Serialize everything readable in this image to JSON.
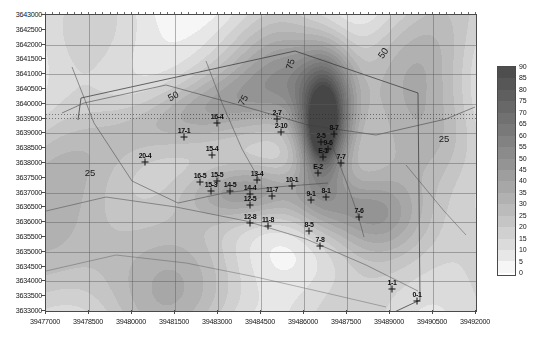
{
  "chart_data": {
    "type": "heatmap",
    "title": "",
    "xlabel": "",
    "ylabel": "",
    "xlim": [
      39477000,
      39492000
    ],
    "ylim": [
      3633000,
      3643000
    ],
    "xticks": [
      39477000,
      39478500,
      39480000,
      39481500,
      39483000,
      39484500,
      39486000,
      39487500,
      39489000,
      39490500,
      39492000
    ],
    "yticks": [
      3633000,
      3633500,
      3634000,
      3634500,
      3635000,
      3635500,
      3636000,
      3636500,
      3637000,
      3637500,
      3638000,
      3638500,
      3639000,
      3639500,
      3640000,
      3640500,
      3641000,
      3641500,
      3642000,
      3642500,
      3643000
    ],
    "grid": true,
    "colorbar": {
      "min": 0,
      "max": 90,
      "step": 5,
      "ticks": [
        90,
        85,
        80,
        75,
        70,
        65,
        60,
        55,
        50,
        45,
        40,
        35,
        30,
        25,
        20,
        15,
        10,
        5,
        0
      ],
      "position": "right",
      "scheme": "grayscale"
    },
    "contour_labels": [
      {
        "text": "50",
        "x": 172,
        "y": 95,
        "rot": -28
      },
      {
        "text": "75",
        "x": 242,
        "y": 99,
        "rot": -62
      },
      {
        "text": "75",
        "x": 289,
        "y": 63,
        "rot": -75
      },
      {
        "text": "50",
        "x": 382,
        "y": 52,
        "rot": -55
      },
      {
        "text": "25",
        "x": 89,
        "y": 171,
        "rot": 0
      },
      {
        "text": "25",
        "x": 443,
        "y": 137,
        "rot": 0
      }
    ],
    "points": [
      {
        "id": "17-1",
        "label": "17-1",
        "x": 183,
        "y": 136
      },
      {
        "id": "16-4",
        "label": "16-4",
        "x": 216,
        "y": 122
      },
      {
        "id": "20-4",
        "label": "20-4",
        "x": 144,
        "y": 161
      },
      {
        "id": "15-4",
        "label": "15-4",
        "x": 211,
        "y": 154
      },
      {
        "id": "16-5",
        "label": "16-5",
        "x": 199,
        "y": 181
      },
      {
        "id": "15-5",
        "label": "15-5",
        "x": 216,
        "y": 180
      },
      {
        "id": "15-3",
        "label": "15-3",
        "x": 210,
        "y": 190
      },
      {
        "id": "14-5",
        "label": "14-5",
        "x": 229,
        "y": 190
      },
      {
        "id": "13-4",
        "label": "13-4",
        "x": 256,
        "y": 179
      },
      {
        "id": "14-4",
        "label": "14-4",
        "x": 249,
        "y": 193
      },
      {
        "id": "12-5",
        "label": "12-5",
        "x": 249,
        "y": 204
      },
      {
        "id": "12-8",
        "label": "12-8",
        "x": 249,
        "y": 222
      },
      {
        "id": "11-8",
        "label": "11-8",
        "x": 267,
        "y": 225
      },
      {
        "id": "10-1",
        "label": "10-1",
        "x": 291,
        "y": 185
      },
      {
        "id": "11-7",
        "label": "11-7",
        "x": 271,
        "y": 195
      },
      {
        "id": "9-1",
        "label": "9-1",
        "x": 310,
        "y": 199
      },
      {
        "id": "8-1",
        "label": "8-1",
        "x": 325,
        "y": 196
      },
      {
        "id": "8-5",
        "label": "8-5",
        "x": 308,
        "y": 230
      },
      {
        "id": "7-8",
        "label": "7-8",
        "x": 319,
        "y": 245
      },
      {
        "id": "7-6",
        "label": "7-6",
        "x": 358,
        "y": 216
      },
      {
        "id": "7-7",
        "label": "7-7",
        "x": 340,
        "y": 162
      },
      {
        "id": "E-1",
        "label": "E-1",
        "x": 322,
        "y": 156
      },
      {
        "id": "E-2",
        "label": "E-2",
        "x": 317,
        "y": 172
      },
      {
        "id": "8-7",
        "label": "8-7",
        "x": 333,
        "y": 133
      },
      {
        "id": "2-5",
        "label": "2-5",
        "x": 320,
        "y": 141
      },
      {
        "id": "9-6",
        "label": "9-6",
        "x": 327,
        "y": 148
      },
      {
        "id": "2-7",
        "label": "2-7",
        "x": 276,
        "y": 118
      },
      {
        "id": "2-10",
        "label": "2-10",
        "x": 280,
        "y": 131
      },
      {
        "id": "1-1",
        "label": "1-1",
        "x": 391,
        "y": 288
      },
      {
        "id": "0-1",
        "label": "0-1",
        "x": 416,
        "y": 300
      }
    ]
  },
  "axes": {
    "y_labels": [
      "3643000",
      "3642500",
      "3642000",
      "3641500",
      "3641000",
      "3640500",
      "3640000",
      "3639500",
      "3639000",
      "3638500",
      "3638000",
      "3637500",
      "3637000",
      "3636500",
      "3636000",
      "3635500",
      "3635000",
      "3634500",
      "3634000",
      "3633500",
      "3633000"
    ],
    "x_labels": [
      "39477000",
      "39478500",
      "39480000",
      "39481500",
      "39483000",
      "39484500",
      "39486000",
      "39487500",
      "39489000",
      "39490500",
      "39492000"
    ]
  },
  "legend": {
    "labels": [
      "90",
      "85",
      "80",
      "75",
      "70",
      "65",
      "60",
      "55",
      "50",
      "45",
      "40",
      "35",
      "30",
      "25",
      "20",
      "15",
      "10",
      "5",
      "0"
    ]
  },
  "colors": {
    "frame": "#4a4a4a",
    "grid": "#5a5a5a",
    "text": "#141414",
    "marker": "#101010"
  }
}
